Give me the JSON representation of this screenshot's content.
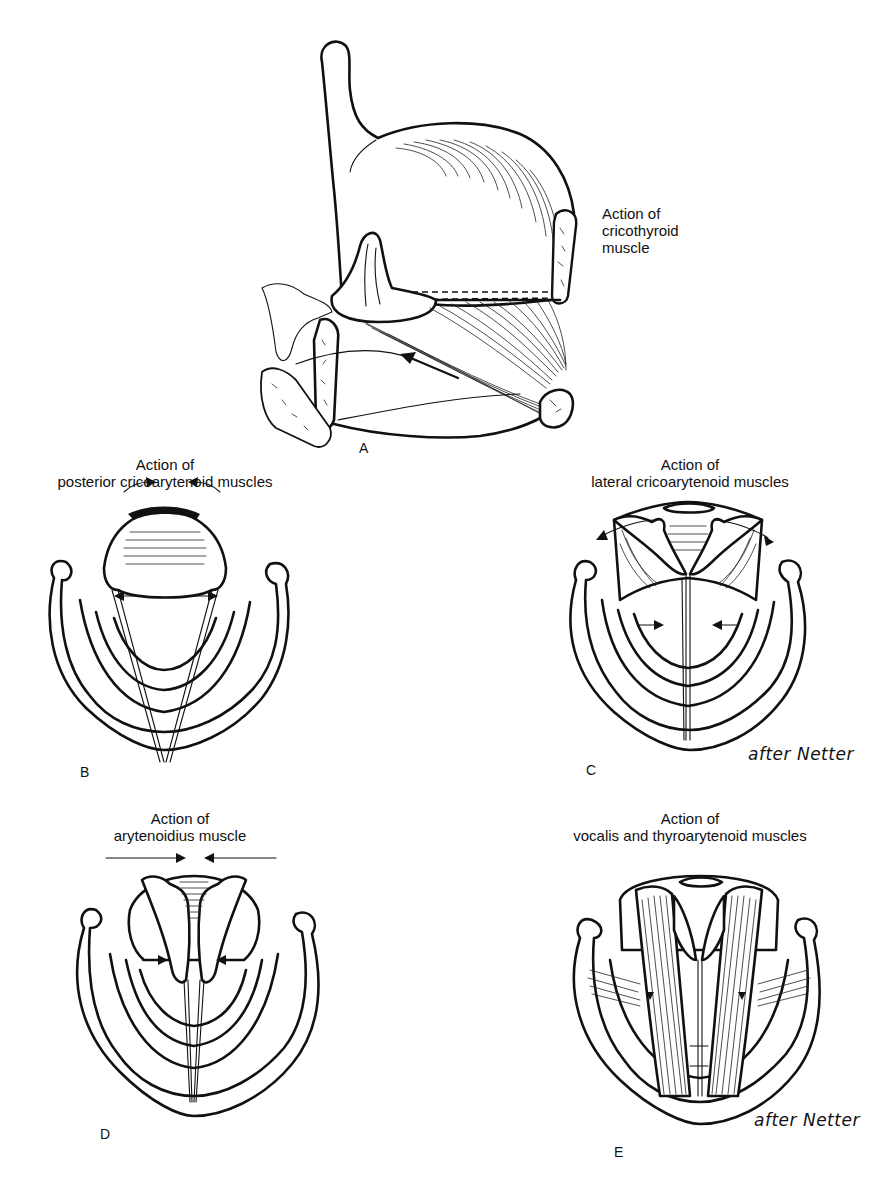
{
  "figure": {
    "panels": [
      {
        "id": "A",
        "letter": "A",
        "caption_line1": "Action of",
        "caption_line2": "cricothyroid",
        "caption_line3": "muscle"
      },
      {
        "id": "B",
        "letter": "B",
        "caption_line1": "Action of",
        "caption_line2": "posterior cricoarytenoid muscles"
      },
      {
        "id": "C",
        "letter": "C",
        "caption_line1": "Action of",
        "caption_line2": "lateral cricoarytenoid muscles",
        "attribution": "after Netter"
      },
      {
        "id": "D",
        "letter": "D",
        "caption_line1": "Action of",
        "caption_line2": "arytenoidius muscle"
      },
      {
        "id": "E",
        "letter": "E",
        "caption_line1": "Action of",
        "caption_line2": "vocalis and thyroarytenoid muscles",
        "attribution": "after Netter"
      }
    ],
    "colors": {
      "ink": "#111111",
      "background": "#ffffff"
    }
  }
}
